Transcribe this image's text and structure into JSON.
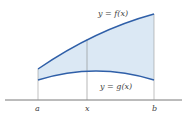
{
  "diagram": {
    "curves": [
      {
        "name": "f",
        "label": "y = f(x)"
      },
      {
        "name": "g",
        "label": "y = g(x)"
      }
    ],
    "axis_labels": {
      "a": "a",
      "x": "x",
      "b": "b"
    },
    "colors": {
      "curve": "#2f5fa8",
      "fill": "#dbe8f4",
      "axis": "#555555",
      "vertical": "#888888"
    }
  }
}
